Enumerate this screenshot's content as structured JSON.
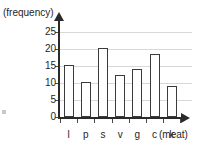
{
  "chart_data": {
    "type": "bar",
    "title": "",
    "subtitle": "",
    "xlabel": "(meat)",
    "ylabel": "(frequency)",
    "categories": [
      "l",
      "p",
      "s",
      "v",
      "g",
      "c",
      "k"
    ],
    "values": [
      15.3,
      10.3,
      20.3,
      12.4,
      14.0,
      18.4,
      9.0
    ],
    "ylim": [
      0,
      27
    ],
    "yticks": [
      0,
      5,
      10,
      15,
      20,
      25
    ],
    "ytick_labels": [
      "0",
      "5",
      "10",
      "15",
      "20",
      "25"
    ],
    "grid": "horizontal",
    "legend": "none",
    "bar_fill_color": "#ffffff",
    "bar_edge_color": "#3b3b3b",
    "grid_color": "#d8d8d8",
    "axis_color": "#2b2b2b",
    "text_color": "#262626",
    "background_color": "#ffffff",
    "annotations": []
  }
}
